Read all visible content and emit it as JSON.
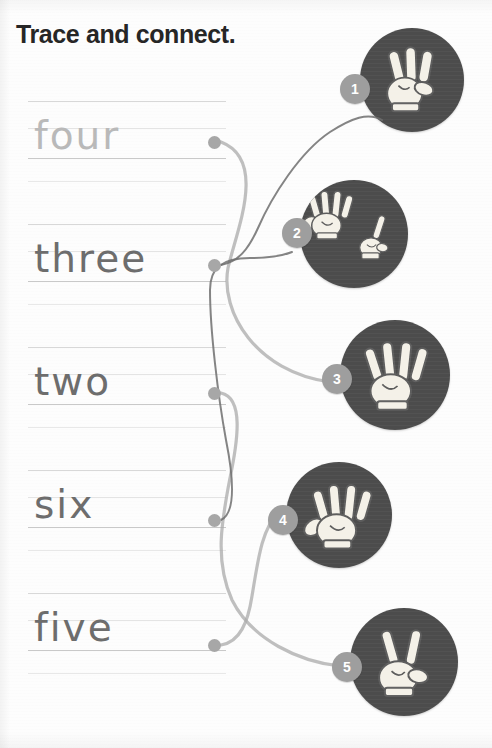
{
  "worksheet": {
    "title": "Trace and connect.",
    "instruction_text": "Trace and connect."
  },
  "colors": {
    "page_background": "#fdfdfd",
    "title_text": "#262626",
    "trace_word_light": "#b9b9b9",
    "trace_word_dark": "#6d6d6d",
    "rule_line": "#d8d8d8",
    "baseline": "#c9c9c9",
    "circle_fill": "#4c4c4c",
    "badge_fill": "#9e9e9e",
    "badge_text": "#ffffff",
    "connector_dot": "#a7a7a7",
    "connector_line_light": "#a9a9a9",
    "connector_line_dark": "#6f6f6f",
    "hand_fill": "#f2efe6",
    "hand_outline": "#5a5a5a"
  },
  "words": [
    {
      "id": "word-four",
      "label": "four",
      "number": 4,
      "style": "light",
      "dot_x": 214,
      "dot_y": 142,
      "row_top": 101
    },
    {
      "id": "word-three",
      "label": "three",
      "number": 3,
      "style": "dark",
      "dot_x": 214,
      "dot_y": 265,
      "row_top": 224
    },
    {
      "id": "word-two",
      "label": "two",
      "number": 2,
      "style": "dark",
      "dot_x": 214,
      "dot_y": 393,
      "row_top": 347
    },
    {
      "id": "word-six",
      "label": "six",
      "number": 6,
      "style": "dark",
      "dot_x": 214,
      "dot_y": 520,
      "row_top": 470
    },
    {
      "id": "word-five",
      "label": "five",
      "number": 5,
      "style": "dark",
      "dot_x": 214,
      "dot_y": 645,
      "row_top": 593
    }
  ],
  "circles": [
    {
      "id": "circle-1",
      "badge": "1",
      "hand": "hand-three-fingers",
      "fingers": 3,
      "represents": "three",
      "x": 360,
      "y": 28,
      "size": 104,
      "badge_x": 340,
      "badge_y": 74
    },
    {
      "id": "circle-2",
      "badge": "2",
      "hand": "hand-five-plus-one",
      "fingers": 6,
      "represents": "six",
      "x": 300,
      "y": 180,
      "size": 108,
      "badge_x": 282,
      "badge_y": 218
    },
    {
      "id": "circle-3",
      "badge": "3",
      "hand": "hand-four-fingers",
      "fingers": 4,
      "represents": "four",
      "x": 340,
      "y": 320,
      "size": 110,
      "badge_x": 322,
      "badge_y": 364
    },
    {
      "id": "circle-4",
      "badge": "4",
      "hand": "hand-open-palm",
      "fingers": 5,
      "represents": "five",
      "x": 286,
      "y": 462,
      "size": 106,
      "badge_x": 268,
      "badge_y": 505
    },
    {
      "id": "circle-5",
      "badge": "5",
      "hand": "hand-peace-sign",
      "fingers": 2,
      "represents": "two",
      "x": 350,
      "y": 608,
      "size": 108,
      "badge_x": 332,
      "badge_y": 652
    }
  ],
  "connections": [
    {
      "id": "link-four-to-3",
      "from": "word-four",
      "to": "circle-3",
      "path": "M 221 142 C 268 160, 236 232, 228 268 C 220 312, 256 372, 330 382"
    },
    {
      "id": "link-three-to-1",
      "from": "word-three",
      "to": "circle-1",
      "path": "M 221 265 C 238 262, 248 250, 258 228 C 272 196, 300 152, 330 132 C 352 118, 368 112, 382 120"
    },
    {
      "id": "link-two-to-5",
      "from": "word-two",
      "to": "circle-5",
      "path": "M 221 393 C 244 398, 238 440, 230 478 C 222 520, 214 560, 232 600 C 252 640, 300 662, 340 666"
    },
    {
      "id": "link-six-to-2",
      "from": "word-six",
      "to": "circle-2",
      "path": "M 221 520 C 238 512, 232 470, 226 440 C 218 396, 210 330, 210 290 C 210 268, 222 258, 250 258 C 268 258, 282 256, 292 252"
    },
    {
      "id": "link-five-to-4",
      "from": "word-five",
      "to": "circle-4",
      "path": "M 221 645 C 240 642, 248 622, 252 596 C 258 560, 262 528, 278 514"
    }
  ]
}
